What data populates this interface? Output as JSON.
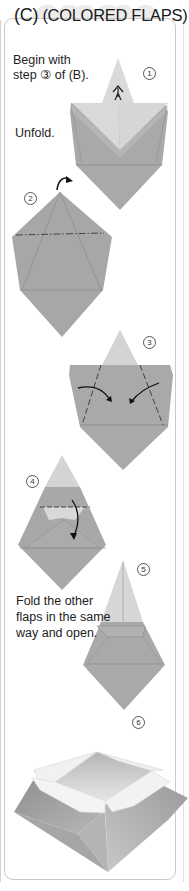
{
  "header": {
    "section_letter": "(C)",
    "section_title": "(COLORED FLAPS)"
  },
  "instructions": {
    "begin": [
      "Begin with",
      "step ③ of (B)."
    ],
    "unfold": "Unfold.",
    "fold_other": [
      "Fold the other",
      "flaps in the same",
      "way and open."
    ]
  },
  "steps": [
    {
      "number": "1",
      "icon": "unfold-arrow-icon"
    },
    {
      "number": "2",
      "icon": "turn-over-arrow-icon"
    },
    {
      "number": "3",
      "icon": "fold-in-arrows-icon"
    },
    {
      "number": "4",
      "icon": "fold-down-arrow-icon"
    },
    {
      "number": "5",
      "icon": ""
    },
    {
      "number": "6",
      "icon": ""
    }
  ],
  "colors": {
    "paper_colored": "#a9a9a9",
    "paper_white": "#d8d8d8",
    "heart": "#ececec",
    "border": "#c9c9c9"
  }
}
